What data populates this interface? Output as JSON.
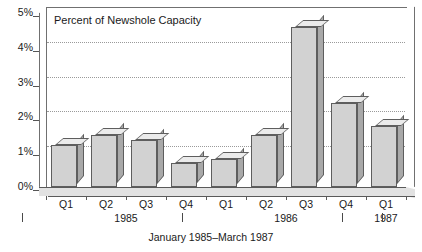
{
  "chart_data": {
    "type": "bar",
    "title": "Percent of Newshole Capacity",
    "xlabel": "January 1985–March 1987",
    "ylabel": "",
    "categories": [
      "Q1",
      "Q2",
      "Q3",
      "Q4",
      "Q1",
      "Q2",
      "Q3",
      "Q4",
      "Q1"
    ],
    "values": [
      1.2,
      1.5,
      1.35,
      0.7,
      0.8,
      1.5,
      4.6,
      2.4,
      1.75
    ],
    "ylim": [
      0,
      5
    ],
    "ytick_labels": [
      "0%",
      "1%",
      "2%",
      "3%",
      "4%",
      "5%"
    ],
    "ytick_values": [
      0,
      1,
      2,
      3,
      4,
      5
    ],
    "grid": true,
    "legend": false,
    "group_labels": [
      "1985",
      "1986",
      "1987"
    ],
    "bar_style": "3d",
    "colors": {
      "bar_front": "#d2d2d2",
      "bar_top": "#ebebeb",
      "bar_side": "#a9a9a9",
      "bar_outline": "#5e5e5e",
      "axis": "#707070",
      "gridline": "#9a9a9a",
      "floor": "#e2e2e2",
      "text": "#1a1a1a"
    }
  },
  "caption": "January 1985–March 1987"
}
